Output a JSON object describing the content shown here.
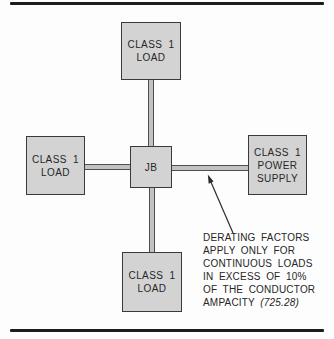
{
  "figure": {
    "type": "wiring-diagram",
    "background": "#fdfdfd",
    "rule_color": "#1c1c1c"
  },
  "colors": {
    "box_fill": "#d3d3d3",
    "box_border": "#3a3a3a",
    "connector_fill": "#c2c2c2",
    "connector_edge": "#4f4f4f",
    "text": "#262626"
  },
  "boxes": {
    "top_load": {
      "lines": [
        "CLASS 1",
        "LOAD"
      ]
    },
    "left_load": {
      "lines": [
        "CLASS 1",
        "LOAD"
      ]
    },
    "junction": {
      "lines": [
        "JB"
      ]
    },
    "power_supply": {
      "lines": [
        "CLASS 1",
        "POWER",
        "SUPPLY"
      ]
    },
    "bottom_load": {
      "lines": [
        "CLASS 1",
        "LOAD"
      ]
    }
  },
  "annotation": {
    "lines": [
      "DERATING FACTORS",
      "APPLY ONLY FOR",
      "CONTINUOUS LOADS",
      "IN EXCESS OF 10%",
      "OF THE CONDUCTOR"
    ],
    "final_line": {
      "text": "AMPACITY",
      "reference": "(725.28)"
    }
  }
}
